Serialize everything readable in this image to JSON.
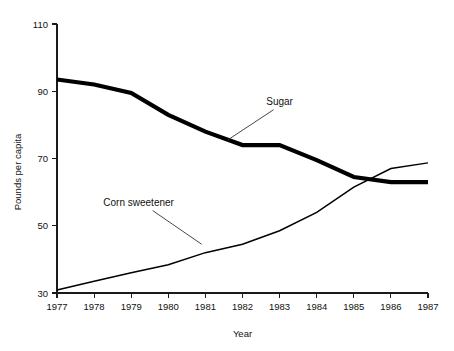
{
  "chart_data": {
    "type": "line",
    "title": "",
    "xlabel": "Year",
    "ylabel": "Pounds per capita",
    "grid": false,
    "legend_position": "inline-annotations",
    "x": [
      1977,
      1978,
      1979,
      1980,
      1981,
      1982,
      1983,
      1984,
      1985,
      1986,
      1987
    ],
    "xtick_labels": [
      "1977",
      "1978",
      "1979",
      "1980",
      "1981",
      "1982",
      "1983",
      "1984",
      "1985",
      "1986",
      "1987"
    ],
    "ytick_labels": [
      "30",
      "50",
      "70",
      "90",
      "110"
    ],
    "yticks": [
      30,
      50,
      70,
      90,
      110
    ],
    "ylim": [
      30,
      110
    ],
    "xlim": [
      1977,
      1987
    ],
    "series": [
      {
        "name": "Sugar",
        "values": [
          93.5,
          92.0,
          89.5,
          83.0,
          78.0,
          74.0,
          74.0,
          69.5,
          64.5,
          63.0,
          63.0
        ],
        "line_width": "thick",
        "color": "#000000",
        "annotation": {
          "label": "Sugar",
          "label_x": 1983.0,
          "label_y": 86.0,
          "points_to_x": 1981.6,
          "points_to_y": 75.5
        }
      },
      {
        "name": "Corn sweetener",
        "values": [
          30.9,
          33.5,
          36.0,
          38.4,
          42.0,
          44.5,
          48.5,
          54.0,
          61.5,
          67.0,
          68.7
        ],
        "line_width": "thin",
        "color": "#000000",
        "annotation": {
          "label": "Corn sweetener",
          "label_x": 1979.2,
          "label_y": 56.0,
          "points_to_x": 1980.9,
          "points_to_y": 44.5
        }
      }
    ]
  },
  "axes": {
    "y_title": "Pounds per capita",
    "x_title": "Year"
  }
}
